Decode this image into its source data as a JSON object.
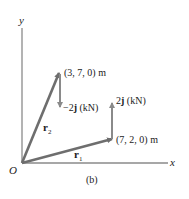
{
  "figure": {
    "caption": "(b)",
    "axes": {
      "x_label": "x",
      "y_label": "y",
      "origin_label": "O"
    },
    "points": [
      {
        "id": "p2",
        "label": "(3, 7, 0) m",
        "coords": [
          3,
          7,
          0
        ]
      },
      {
        "id": "p1",
        "label": "(7, 2, 0) m",
        "coords": [
          7,
          2,
          0
        ]
      }
    ],
    "position_vectors": [
      {
        "name": "r1",
        "symbol": "r",
        "subscript": "1",
        "from": "O",
        "to": "(7, 2, 0)"
      },
      {
        "name": "r2",
        "symbol": "r",
        "subscript": "2",
        "from": "O",
        "to": "(3, 7, 0)"
      }
    ],
    "forces": [
      {
        "id": "f2",
        "coef": "−2",
        "unit_vector": "j",
        "unit": " (kN)",
        "at": "(3, 7, 0)",
        "direction": "down"
      },
      {
        "id": "f1",
        "coef": "2",
        "unit_vector": "j",
        "unit": " (kN)",
        "at": "(7, 2, 0)",
        "direction": "up"
      }
    ],
    "colors": {
      "axis": "#8a8a8a",
      "vector": "#6e6e6e",
      "text": "#222222"
    }
  }
}
